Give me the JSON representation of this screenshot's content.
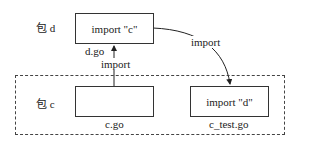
{
  "diagram": {
    "package_d": {
      "label": "包 d",
      "file": {
        "name": "d.go",
        "content": "import \"c\""
      }
    },
    "package_c": {
      "label": "包 c",
      "files": [
        {
          "name": "c.go",
          "content": ""
        },
        {
          "name": "c_test.go",
          "content": "import \"d\""
        }
      ]
    },
    "edges": [
      {
        "from": "c.go",
        "to": "d.go",
        "label": "import"
      },
      {
        "from": "d.go",
        "to": "c_test.go",
        "label": "import"
      }
    ]
  }
}
